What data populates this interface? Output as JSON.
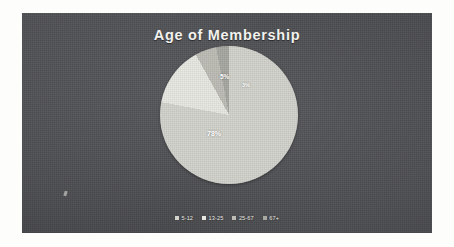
{
  "chart_data": {
    "type": "pie",
    "title": "Age of Membership",
    "categories": [
      "5-12",
      "13-25",
      "25-67",
      "67+"
    ],
    "values": [
      78,
      14,
      5,
      3
    ],
    "labels_shown": [
      "78%",
      "",
      "5%",
      "3%"
    ],
    "colors": [
      "#d3d3cd",
      "#e8e8e2",
      "#bdbdb6",
      "#a8a8a2"
    ],
    "legend_position": "bottom",
    "grid": false,
    "start_angle": 0
  },
  "panel": {
    "background_color": "#55565a",
    "title_color": "#f2f2ee"
  },
  "slice_labels": {
    "main": "78%",
    "small_a": "5%",
    "small_b": "3%"
  },
  "legend": {
    "items": [
      {
        "label": "5-12",
        "color": "#d3d3cd"
      },
      {
        "label": "13-25",
        "color": "#e8e8e2"
      },
      {
        "label": "25-67",
        "color": "#bdbdb6"
      },
      {
        "label": "67+",
        "color": "#a8a8a2"
      }
    ]
  }
}
